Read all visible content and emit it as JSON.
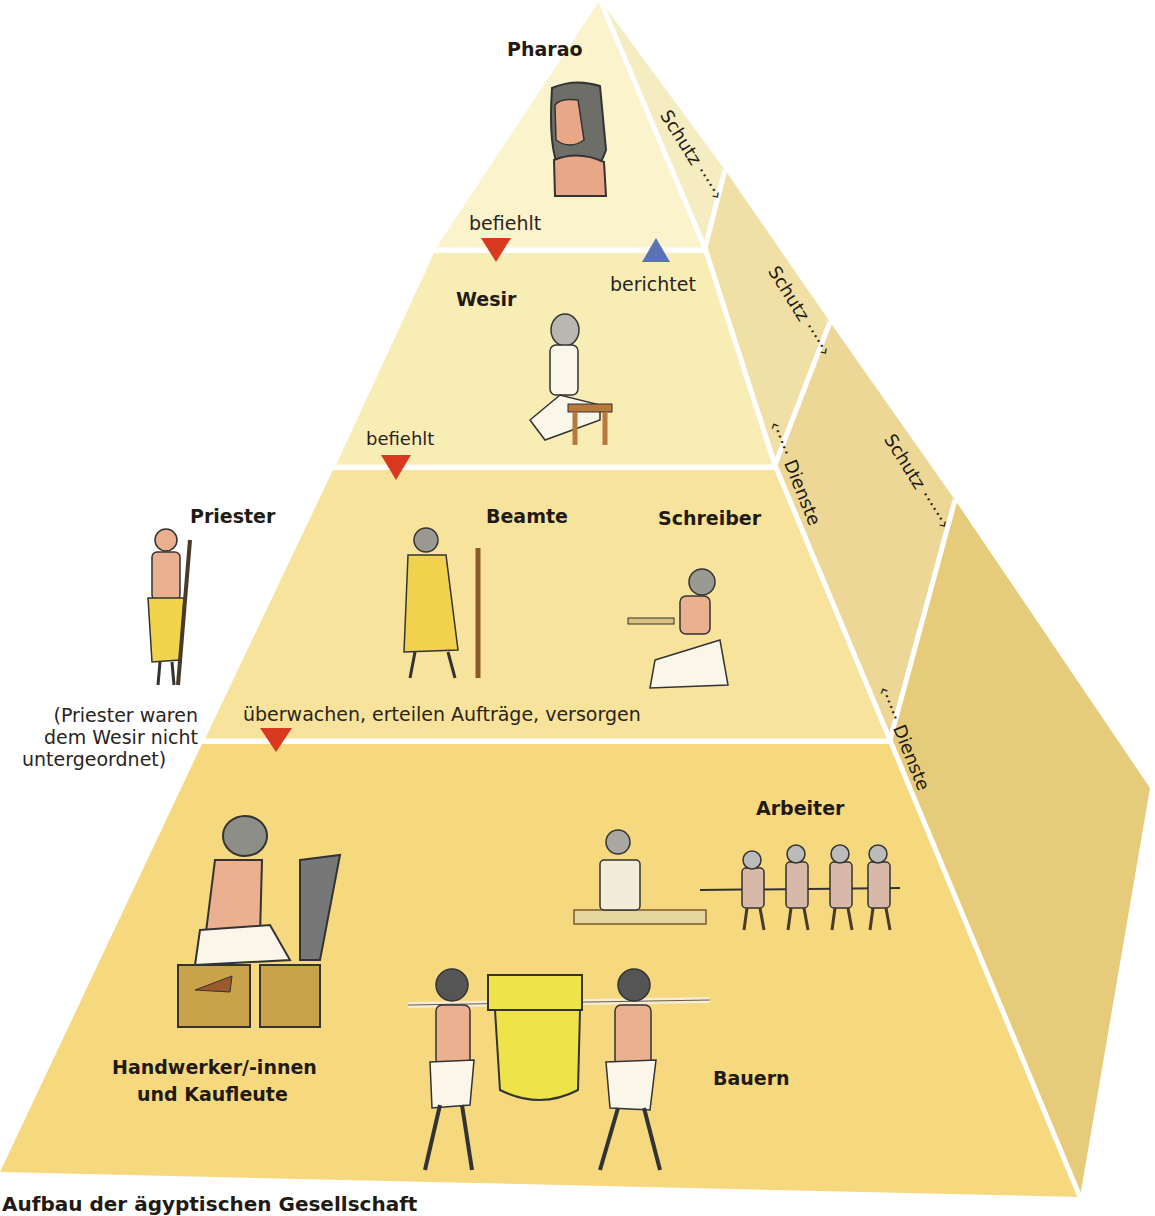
{
  "title": "Aufbau der ägyptischen Gesellschaft",
  "tiers": [
    {
      "id": "pharao",
      "label": "Pharao"
    },
    {
      "id": "wesir",
      "label": "Wesir"
    },
    {
      "id": "beamte",
      "label": "Beamte"
    },
    {
      "id": "schreiber",
      "label": "Schreiber"
    },
    {
      "id": "arbeiter",
      "label": "Arbeiter"
    },
    {
      "id": "handwerker",
      "label": "Handwerker/-innen",
      "label2": "und Kaufleute"
    },
    {
      "id": "bauern",
      "label": "Bauern"
    }
  ],
  "side_group": {
    "label": "Priester",
    "note_line1": "(Priester waren",
    "note_line2": "dem Wesir nicht",
    "note_line3": "untergeordnet)"
  },
  "relations": {
    "pharao_to_wesir": "befiehlt",
    "wesir_to_pharao": "berichtet",
    "wesir_to_beamte": "befiehlt",
    "beamte_to_volk": "überwachen, erteilen Aufträge, versorgen",
    "schutz_1": "Schutz ·····›",
    "schutz_2": "Schutz ·····›",
    "schutz_3": "Schutz ······›",
    "dienste_1": "‹····· Dienste",
    "dienste_2": "‹····· Dienste"
  },
  "colors": {
    "tier1": "#fbf3cc",
    "tier2": "#f9edb6",
    "tier3": "#f8e39c",
    "tier4": "#f6d87f",
    "side1": "#f6ecc2",
    "side2": "#f0e0a6",
    "side3": "#ecd796",
    "side4": "#e6cb7a",
    "arrow_down": "#d9391e",
    "arrow_up": "#5b73b4"
  }
}
